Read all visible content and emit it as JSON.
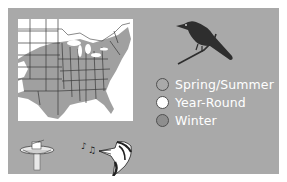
{
  "legend": {
    "items": [
      {
        "label": "Spring/Summer",
        "color": "#a9a9a9"
      },
      {
        "label": "Year-Round",
        "color": "#ffffff"
      },
      {
        "label": "Winter",
        "color": "#8e8e8e"
      }
    ]
  },
  "icons": {
    "bird": "bird-silhouette-icon",
    "map": "range-map",
    "fountain": "birdbath-icon",
    "song": "singing-bird-icon"
  },
  "colors": {
    "panel": "#a9a9a9",
    "range_fill": "#a0a0a0",
    "map_bg": "#ffffff",
    "bird": "#2e2e2e"
  }
}
